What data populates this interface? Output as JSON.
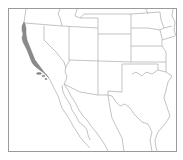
{
  "map": {
    "type": "range-map",
    "region": "Western United States and northwestern Mexico",
    "highlighted_range": {
      "name": "coastal-california-range",
      "description": "Narrow coastal strip along California coast plus Channel Islands",
      "fill": "#8a8a8a"
    },
    "colors": {
      "background": "#ffffff",
      "frame": "#9a9a9a",
      "borders": "#b4b4b4",
      "range_fill": "#8a8a8a"
    }
  }
}
